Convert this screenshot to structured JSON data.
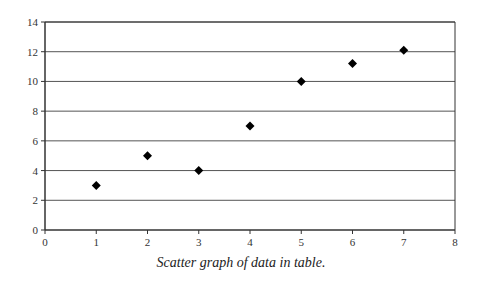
{
  "caption": "Scatter graph of data in table.",
  "colors": {
    "axis": "#333333",
    "grid": "#555555",
    "marker": "#000000",
    "background": "#ffffff"
  },
  "chart_data": {
    "type": "scatter",
    "title": "",
    "xlabel": "",
    "ylabel": "",
    "xlim": [
      0,
      8
    ],
    "ylim": [
      0,
      14
    ],
    "xticks": [
      0,
      1,
      2,
      3,
      4,
      5,
      6,
      7,
      8
    ],
    "yticks": [
      0,
      2,
      4,
      6,
      8,
      10,
      12,
      14
    ],
    "grid": "horizontal",
    "legend": null,
    "marker": "diamond",
    "series": [
      {
        "name": "data",
        "x": [
          1,
          2,
          3,
          4,
          5,
          6,
          7
        ],
        "y": [
          3,
          5,
          4,
          7,
          10,
          11.2,
          12.1
        ]
      }
    ],
    "caption": "Scatter graph of data in table."
  }
}
